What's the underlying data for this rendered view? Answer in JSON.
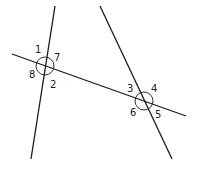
{
  "diagram": {
    "type": "geometry-angles",
    "lines": [
      {
        "name": "left-line",
        "x1": 55,
        "y1": 6,
        "x2": 31,
        "y2": 159
      },
      {
        "name": "right-line",
        "x1": 100,
        "y1": 6,
        "x2": 172,
        "y2": 159
      },
      {
        "name": "transversal",
        "x1": 12,
        "y1": 54,
        "x2": 186,
        "y2": 116
      }
    ],
    "intersections": [
      {
        "name": "left-intersection",
        "x": 45,
        "y": 66
      },
      {
        "name": "right-intersection",
        "x": 144,
        "y": 101
      }
    ],
    "angle_labels": [
      {
        "text": "1",
        "x": 35,
        "y": 53
      },
      {
        "text": "7",
        "x": 54,
        "y": 61
      },
      {
        "text": "8",
        "x": 29,
        "y": 78
      },
      {
        "text": "2",
        "x": 50,
        "y": 88
      },
      {
        "text": "3",
        "x": 127,
        "y": 92
      },
      {
        "text": "4",
        "x": 151,
        "y": 92
      },
      {
        "text": "6",
        "x": 130,
        "y": 116
      },
      {
        "text": "5",
        "x": 155,
        "y": 118
      }
    ]
  }
}
